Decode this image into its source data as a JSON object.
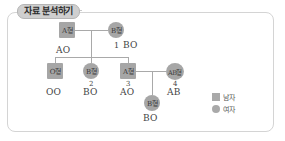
{
  "title": "자료 분석하기",
  "legend": {
    "male": {
      "shape": "square",
      "label": "남자"
    },
    "female": {
      "shape": "circle",
      "label": "여자"
    }
  },
  "pedigree": {
    "generation1": {
      "father": {
        "shape": "square",
        "blood_type": "A형",
        "genotype": "AO",
        "number": ""
      },
      "mother": {
        "shape": "circle",
        "blood_type": "B형",
        "genotype": "BO",
        "number": "1"
      }
    },
    "generation2": [
      {
        "shape": "square",
        "blood_type": "O형",
        "genotype": "OO",
        "number": ""
      },
      {
        "shape": "circle",
        "blood_type": "B형",
        "genotype": "BO",
        "number": "2"
      },
      {
        "shape": "square",
        "blood_type": "A형",
        "genotype": "AO",
        "number": "3"
      }
    ],
    "spouse": {
      "shape": "circle",
      "blood_type": "AB형",
      "genotype": "AB",
      "number": "4"
    },
    "generation3": [
      {
        "shape": "circle",
        "blood_type": "B형",
        "genotype": "BO",
        "number": ""
      }
    ]
  },
  "colors": {
    "node_fill": "#a6a6a6",
    "line": "#a9a9a9",
    "frame_border": "#d4d4d4",
    "badge_fill": "#cfcfcf"
  }
}
